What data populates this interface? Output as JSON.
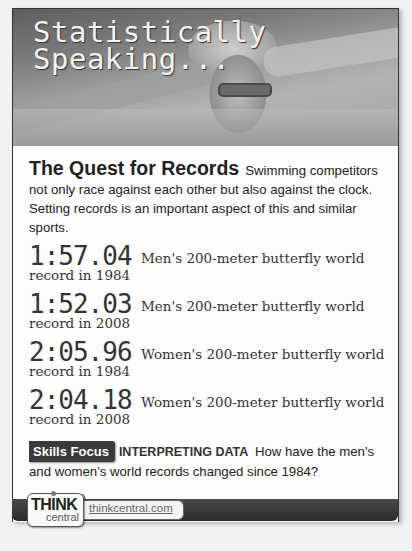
{
  "header": {
    "title_line1": "Statistically",
    "title_line2": "Speaking..."
  },
  "intro": {
    "heading": "The Quest for Records",
    "text": "Swimming competitors not only race against each other but also against the clock. Setting records is an important aspect of this and similar sports."
  },
  "records": [
    {
      "time": "1:57.04",
      "description": "Men's 200-meter butterfly world",
      "subtitle": "record in 1984"
    },
    {
      "time": "1:52.03",
      "description": "Men's 200-meter butterfly world",
      "subtitle": "record in 2008"
    },
    {
      "time": "2:05.96",
      "description": "Women's 200-meter butterfly world",
      "subtitle": "record in 1984"
    },
    {
      "time": "2:04.18",
      "description": "Women's 200-meter butterfly world",
      "subtitle": "record in 2008"
    }
  ],
  "skills": {
    "badge": "Skills Focus",
    "label": "INTERPRETING DATA",
    "question": "How have the men's and women's world records changed since 1984?"
  },
  "source": "Source: FINA",
  "footer": {
    "logo_top": "THINK",
    "logo_bottom": "central",
    "link": "thinkcentral.com"
  },
  "colors": {
    "text": "#222222",
    "badge_bg": "#3a3a3a",
    "footer_bar": "#2a2a2a"
  }
}
